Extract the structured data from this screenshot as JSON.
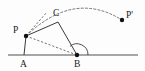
{
  "figure": {
    "background_color": "#fdfdfd",
    "stroke_color": "#333333",
    "dash_color": "#555555",
    "label_color": "#1a1a1a",
    "width": 145,
    "height": 71
  },
  "labels": {
    "P": "P",
    "C": "C",
    "P_prime": "P'",
    "A": "A",
    "B": "B"
  },
  "points": {
    "P": {
      "x": 26,
      "y": 36
    },
    "C": {
      "x": 58,
      "y": 22
    },
    "Pp": {
      "x": 122,
      "y": 20
    },
    "A": {
      "x": 24,
      "y": 55
    },
    "B": {
      "x": 77,
      "y": 55
    }
  },
  "label_positions": {
    "P": {
      "x": 13,
      "y": 33
    },
    "C": {
      "x": 53,
      "y": 16
    },
    "Pp": {
      "x": 126,
      "y": 18
    },
    "A": {
      "x": 20,
      "y": 67
    },
    "B": {
      "x": 74,
      "y": 67
    }
  },
  "baseline": {
    "x1": 8,
    "y1": 55,
    "x2": 138,
    "y2": 55
  },
  "solid_segments": [
    {
      "name": "segment-A-P",
      "x1": 24,
      "y1": 55,
      "x2": 26,
      "y2": 36
    },
    {
      "name": "segment-P-C",
      "x1": 26,
      "y1": 36,
      "x2": 58,
      "y2": 22
    },
    {
      "name": "segment-C-B",
      "x1": 58,
      "y1": 22,
      "x2": 77,
      "y2": 55
    }
  ],
  "dashed_segments": [
    {
      "name": "segment-P-B-diagonal",
      "x1": 26,
      "y1": 36,
      "x2": 77,
      "y2": 55
    },
    {
      "name": "ray-P-upper",
      "x1": 26,
      "y1": 36,
      "x2": 47,
      "y2": 12
    },
    {
      "name": "ray-B-to-P",
      "x1": 77,
      "y1": 55,
      "x2": 26,
      "y2": 36
    }
  ],
  "dashed_arc": {
    "name": "rotation-arc-P-to-P-prime",
    "start": {
      "x": 26,
      "y": 36
    },
    "end": {
      "x": 122,
      "y": 20
    },
    "apex": {
      "x": 75,
      "y": 5
    },
    "path": "M 26 36 Q 74 -10 122 20"
  },
  "angle_arc": {
    "name": "angle-at-B",
    "vertex": {
      "x": 77,
      "y": 55
    },
    "radius": 11,
    "path": "M 88 55 A 11 11 0 0 0 70 46.3"
  },
  "dots": [
    {
      "name": "vertex-dot-P",
      "x": 26,
      "y": 36,
      "r": 2.2
    },
    {
      "name": "vertex-dot-B",
      "x": 77,
      "y": 55,
      "r": 2.2
    },
    {
      "name": "vertex-dot-P-prime",
      "x": 122,
      "y": 20,
      "r": 2.2
    }
  ]
}
